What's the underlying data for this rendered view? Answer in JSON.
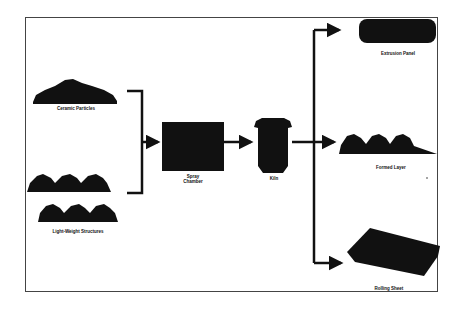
{
  "diagram": {
    "type": "process-flow",
    "inputs": [
      {
        "id": "input-1",
        "label": "Ceramic Particles",
        "shape": "mound"
      },
      {
        "id": "input-2",
        "label": "Light-Weight Structures",
        "shape": "corrugated-stack"
      }
    ],
    "stages": [
      {
        "id": "stage-1",
        "label_lines": [
          "Spray",
          "Chamber"
        ],
        "shape": "box"
      },
      {
        "id": "stage-2",
        "label": "Kiln",
        "shape": "pot"
      }
    ],
    "outputs": [
      {
        "id": "output-1",
        "label": "Extrusion Panel",
        "shape": "rounded-slab"
      },
      {
        "id": "output-2",
        "label": "Formed Layer",
        "shape": "corrugated"
      },
      {
        "id": "output-3",
        "label": "Rolling Sheet",
        "shape": "tilted-slab"
      }
    ],
    "connections": [
      [
        "input-1",
        "stage-1"
      ],
      [
        "input-2",
        "stage-1"
      ],
      [
        "stage-1",
        "stage-2"
      ],
      [
        "stage-2",
        "output-1"
      ],
      [
        "stage-2",
        "output-2"
      ],
      [
        "stage-2",
        "output-3"
      ]
    ],
    "colors": {
      "ink": "#111111",
      "frame": "#444444",
      "background": "#ffffff"
    }
  }
}
